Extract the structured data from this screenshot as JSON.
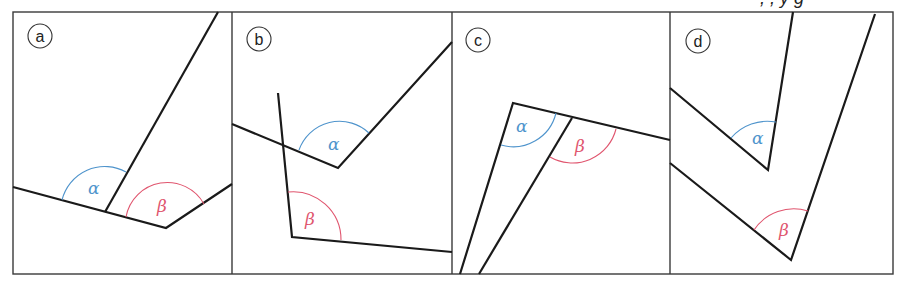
{
  "figure": {
    "top_cropped_text": ", , y g",
    "colors": {
      "alpha": "#4f94cc",
      "beta": "#e0556e",
      "line": "#1a1a1a",
      "frame": "#3a3a3a"
    },
    "panels": [
      {
        "id": "a",
        "label": "a",
        "alpha_label": "α",
        "beta_label": "β"
      },
      {
        "id": "b",
        "label": "b",
        "alpha_label": "α",
        "beta_label": "β"
      },
      {
        "id": "c",
        "label": "c",
        "alpha_label": "α",
        "beta_label": "β"
      },
      {
        "id": "d",
        "label": "d",
        "alpha_label": "α",
        "beta_label": "β"
      }
    ]
  }
}
